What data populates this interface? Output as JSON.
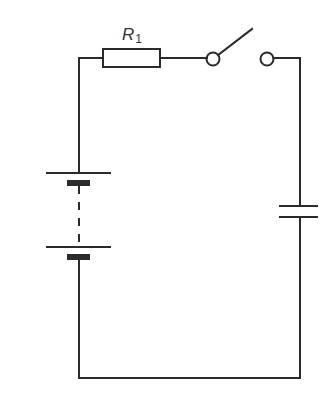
{
  "diagram": {
    "type": "circuit-schematic",
    "colors": {
      "line": "#2b2b2b",
      "background": "#ffffff",
      "label": "#333333"
    },
    "components": {
      "resistor": {
        "label_main": "R",
        "label_sub": "1"
      },
      "switch": {
        "state": "open"
      },
      "battery": {
        "cells": 2,
        "connection": "dashed (multiple cells)"
      },
      "capacitor": {
        "label": ""
      }
    }
  }
}
